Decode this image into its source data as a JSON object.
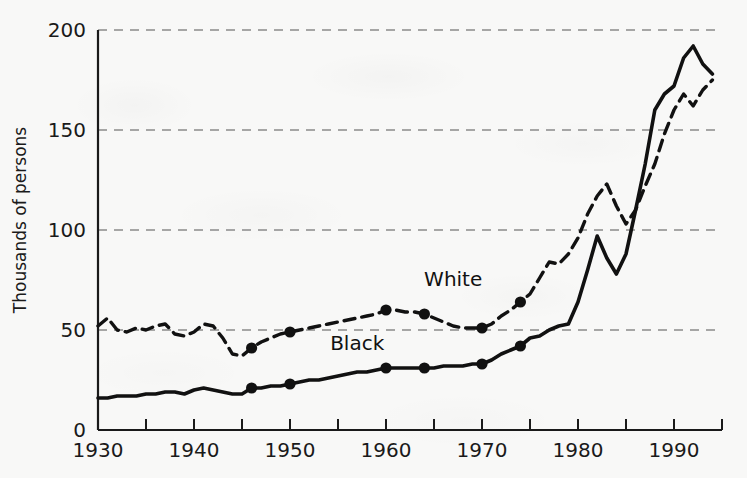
{
  "chart_data": {
    "type": "line",
    "title": "",
    "xlabel": "",
    "ylabel": "Thousands of persons",
    "xlim": [
      1930,
      1995
    ],
    "ylim": [
      0,
      200
    ],
    "grid": true,
    "grid_axis": "y",
    "legend": "inline-annotation",
    "y_ticks": [
      0,
      50,
      100,
      150,
      200
    ],
    "y_tick_labels": [
      "0",
      "50",
      "100",
      "150",
      "200"
    ],
    "x_ticks": [
      1930,
      1935,
      1940,
      1945,
      1950,
      1955,
      1960,
      1965,
      1970,
      1975,
      1980,
      1985,
      1990,
      1995
    ],
    "x_tick_labels_shown": [
      "1930",
      "1940",
      "1950",
      "1960",
      "1970",
      "1980",
      "1990"
    ],
    "x_labeled_ticks": [
      1930,
      1940,
      1950,
      1960,
      1970,
      1980,
      1990
    ],
    "annotations": [
      {
        "text": "White",
        "x": 1967,
        "y": 72
      },
      {
        "text": "Black",
        "x": 1957,
        "y": 40
      }
    ],
    "series": [
      {
        "name": "White",
        "style": "dashed",
        "color": "#111111",
        "x": [
          1930,
          1931,
          1932,
          1933,
          1934,
          1935,
          1936,
          1937,
          1938,
          1939,
          1940,
          1941,
          1942,
          1943,
          1944,
          1945,
          1946,
          1947,
          1948,
          1949,
          1950,
          1951,
          1952,
          1953,
          1954,
          1955,
          1956,
          1957,
          1958,
          1959,
          1960,
          1961,
          1962,
          1963,
          1964,
          1965,
          1966,
          1967,
          1968,
          1969,
          1970,
          1971,
          1972,
          1973,
          1974,
          1975,
          1976,
          1977,
          1978,
          1979,
          1980,
          1981,
          1982,
          1983,
          1984,
          1985,
          1986,
          1987,
          1988,
          1989,
          1990,
          1991,
          1992,
          1993,
          1994
        ],
        "y": [
          52,
          56,
          50,
          49,
          51,
          50,
          52,
          53,
          48,
          47,
          49,
          53,
          52,
          46,
          38,
          37,
          41,
          44,
          46,
          48,
          49,
          50,
          51,
          52,
          53,
          54,
          55,
          56,
          57,
          58,
          60,
          60,
          59,
          59,
          58,
          56,
          54,
          52,
          51,
          51,
          51,
          53,
          57,
          60,
          64,
          68,
          76,
          84,
          83,
          88,
          96,
          108,
          117,
          123,
          112,
          103,
          110,
          122,
          133,
          148,
          160,
          168,
          162,
          170,
          175
        ],
        "markers": [
          {
            "x": 1946,
            "y": 41
          },
          {
            "x": 1950,
            "y": 49
          },
          {
            "x": 1960,
            "y": 60
          },
          {
            "x": 1964,
            "y": 58
          },
          {
            "x": 1970,
            "y": 51
          },
          {
            "x": 1974,
            "y": 64
          }
        ]
      },
      {
        "name": "Black",
        "style": "solid",
        "color": "#111111",
        "x": [
          1930,
          1931,
          1932,
          1933,
          1934,
          1935,
          1936,
          1937,
          1938,
          1939,
          1940,
          1941,
          1942,
          1943,
          1944,
          1945,
          1946,
          1947,
          1948,
          1949,
          1950,
          1951,
          1952,
          1953,
          1954,
          1955,
          1956,
          1957,
          1958,
          1959,
          1960,
          1961,
          1962,
          1963,
          1964,
          1965,
          1966,
          1967,
          1968,
          1969,
          1970,
          1971,
          1972,
          1973,
          1974,
          1975,
          1976,
          1977,
          1978,
          1979,
          1980,
          1981,
          1982,
          1983,
          1984,
          1985,
          1986,
          1987,
          1988,
          1989,
          1990,
          1991,
          1992,
          1993,
          1994
        ],
        "y": [
          16,
          16,
          17,
          17,
          17,
          18,
          18,
          19,
          19,
          18,
          20,
          21,
          20,
          19,
          18,
          18,
          21,
          21,
          22,
          22,
          23,
          24,
          25,
          25,
          26,
          27,
          28,
          29,
          29,
          30,
          31,
          31,
          31,
          31,
          31,
          31,
          32,
          32,
          32,
          33,
          33,
          35,
          38,
          40,
          42,
          46,
          47,
          50,
          52,
          53,
          64,
          80,
          97,
          86,
          78,
          88,
          110,
          133,
          160,
          168,
          172,
          186,
          192,
          183,
          178
        ],
        "markers": [
          {
            "x": 1946,
            "y": 21
          },
          {
            "x": 1950,
            "y": 23
          },
          {
            "x": 1960,
            "y": 31
          },
          {
            "x": 1964,
            "y": 31
          },
          {
            "x": 1970,
            "y": 33
          },
          {
            "x": 1974,
            "y": 42
          }
        ]
      }
    ]
  }
}
